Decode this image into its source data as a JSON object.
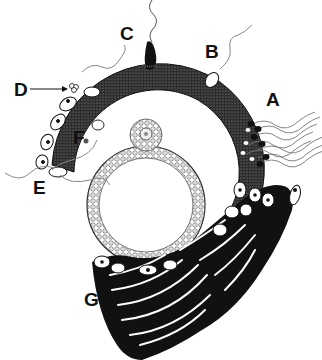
{
  "figure": {
    "labels": {
      "A": "A",
      "B": "B",
      "C": "C",
      "D": "D",
      "E": "E",
      "F": "F",
      "G": "G"
    },
    "colors": {
      "background": "#ffffff",
      "ink": "#111111",
      "zona_stipple": "#3a3a3a",
      "cell_fill": "#ffffff",
      "granulosa_fill": "#d9d9d9"
    }
  }
}
